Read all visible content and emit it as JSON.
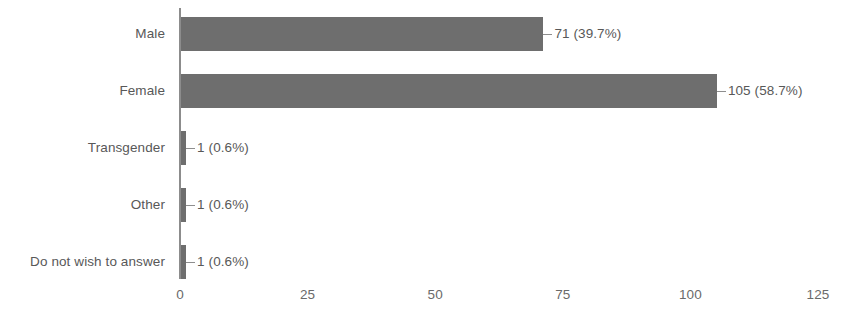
{
  "chart_data": {
    "type": "bar",
    "orientation": "horizontal",
    "title": "",
    "xlabel": "",
    "ylabel": "",
    "xlim": [
      0,
      125
    ],
    "xticks": [
      0,
      25,
      50,
      75,
      100,
      125
    ],
    "xtick_labels": [
      "0",
      "25",
      "50",
      "75",
      "100",
      "125"
    ],
    "grid": false,
    "legend": null,
    "bar_color": "#6e6e6e",
    "axis_color": "#8c8c8c",
    "text_color": "#585858",
    "categories": [
      "Male",
      "Female",
      "Transgender",
      "Other",
      "Do not wish to answer"
    ],
    "values": [
      71,
      105,
      1,
      1,
      1
    ],
    "percentages": [
      39.7,
      58.7,
      0.6,
      0.6,
      0.6
    ],
    "data_labels": [
      "71 (39.7%)",
      "105 (58.7%)",
      "1 (0.6%)",
      "1 (0.6%)",
      "1 (0.6%)"
    ],
    "bars": [
      {
        "category": "Male",
        "value": 71,
        "percent": 39.7,
        "label": "71 (39.7%)"
      },
      {
        "category": "Female",
        "value": 105,
        "percent": 58.7,
        "label": "105 (58.7%)"
      },
      {
        "category": "Transgender",
        "value": 1,
        "percent": 0.6,
        "label": "1 (0.6%)"
      },
      {
        "category": "Other",
        "value": 1,
        "percent": 0.6,
        "label": "1 (0.6%)"
      },
      {
        "category": "Do not wish to answer",
        "value": 1,
        "percent": 0.6,
        "label": "1 (0.6%)"
      }
    ]
  }
}
